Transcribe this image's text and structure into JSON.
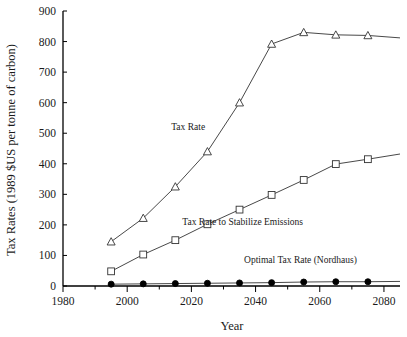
{
  "chart_data": {
    "type": "line",
    "title": "",
    "xlabel": "Year",
    "ylabel": "Tax Rates (1989 $US per tonne of carbon)",
    "xlim": [
      1980,
      2085
    ],
    "ylim": [
      0,
      900
    ],
    "xticks": [
      1980,
      2000,
      2020,
      2040,
      2060,
      2080
    ],
    "xtick_labels": [
      "1980",
      "2000",
      "2020",
      "2040",
      "2060",
      "2080"
    ],
    "yticks": [
      0,
      100,
      200,
      300,
      400,
      500,
      600,
      700,
      800,
      900
    ],
    "ytick_labels": [
      "0",
      "100",
      "200",
      "300",
      "400",
      "500",
      "600",
      "700",
      "800",
      "900"
    ],
    "x_minor_tick_interval": 10,
    "grid": false,
    "legend": "inline-annotations",
    "x": [
      1995,
      2005,
      2015,
      2025,
      2035,
      2045,
      2055,
      2065,
      2075,
      2085
    ],
    "series": [
      {
        "name": "Tax Rate",
        "marker": "open-triangle",
        "values": [
          145,
          222,
          325,
          440,
          600,
          792,
          830,
          822,
          820,
          812
        ]
      },
      {
        "name": "Tax Rate to Stabilize Emissions",
        "marker": "open-square",
        "values": [
          48,
          103,
          150,
          202,
          250,
          298,
          347,
          399,
          415,
          432
        ]
      },
      {
        "name": "Optimal Tax Rate (Nordhaus)",
        "marker": "filled-circle",
        "values": [
          6,
          7,
          8,
          9,
          10,
          11,
          13,
          14,
          14,
          15
        ]
      }
    ],
    "annotations": [
      {
        "text": "Tax Rate",
        "x": 2019,
        "y": 510
      },
      {
        "text": "Tax Rate to Stabilize Emissions",
        "x": 2036,
        "y": 200
      },
      {
        "text": "Optimal Tax Rate (Nordhaus)",
        "x": 2054,
        "y": 75
      }
    ],
    "colors": {
      "axis": "#000000",
      "line": "#333333",
      "marker_fill_open": "#ffffff",
      "marker_fill_solid": "#000000",
      "background": "#ffffff"
    }
  }
}
